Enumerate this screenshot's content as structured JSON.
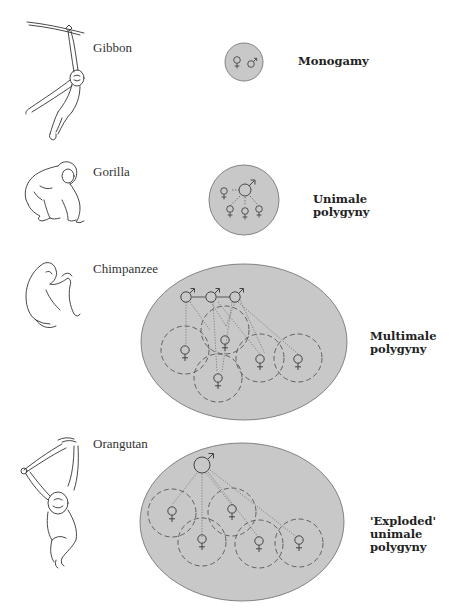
{
  "figure": {
    "rows": [
      {
        "species": "Gibbon",
        "system": [
          "Monogamy"
        ],
        "males": 1,
        "females": 1,
        "territory_shape": "small circle",
        "female_ranges_dashed": false
      },
      {
        "species": "Gorilla",
        "system": [
          "Unimale",
          "polygyny"
        ],
        "males": 1,
        "females": 4,
        "territory_shape": "circle",
        "female_ranges_dashed": false
      },
      {
        "species": "Chimpanzee",
        "system": [
          "Multimale",
          "polygyny"
        ],
        "males": 3,
        "females": 5,
        "territory_shape": "large ellipse",
        "female_ranges_dashed": true
      },
      {
        "species": "Orangutan",
        "system": [
          "'Exploded'",
          "unimale",
          "polygyny"
        ],
        "males": 1,
        "females": 5,
        "territory_shape": "large ellipse",
        "female_ranges_dashed": true
      }
    ],
    "symbols": {
      "female": "♀",
      "male": "♂"
    },
    "colors": {
      "territory_fill": "#c8c8c8",
      "territory_stroke": "#777777",
      "line": "#555555",
      "text": "#222222"
    }
  }
}
